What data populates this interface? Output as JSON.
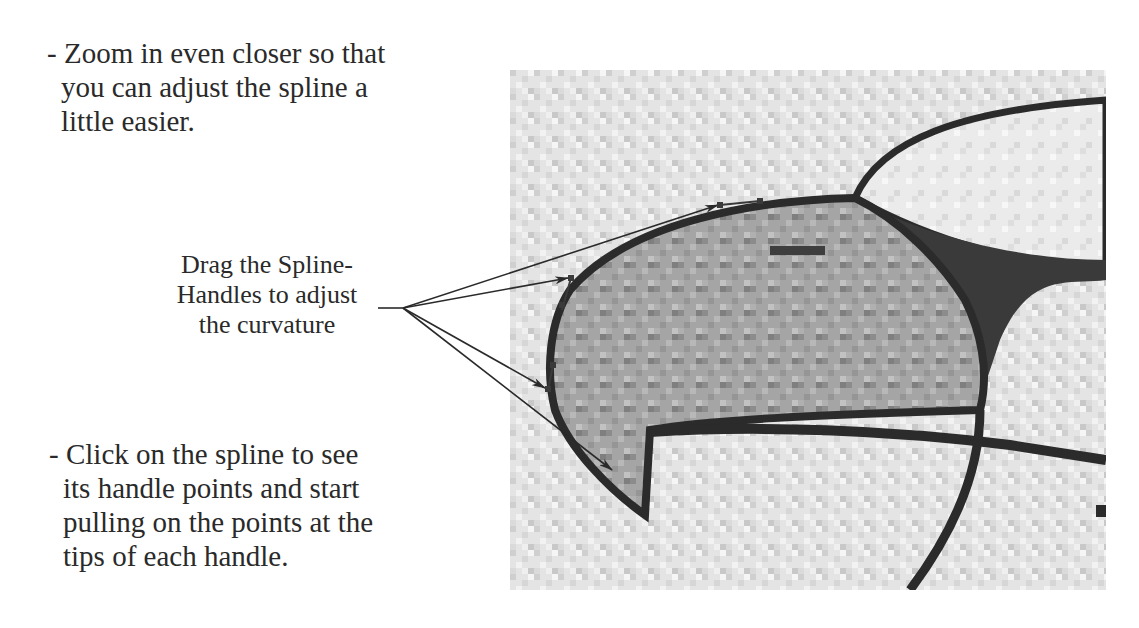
{
  "instructions": {
    "top": {
      "bullet": "-",
      "lines": [
        "Zoom in even closer so that",
        "you can adjust the spline a",
        "little easier."
      ]
    },
    "bottom": {
      "bullet": "-",
      "lines": [
        "Click on the spline to see",
        "its handle points and start",
        "pulling on the points at the",
        "tips of each handle."
      ]
    }
  },
  "callout": {
    "lines": [
      "Drag the Spline-",
      "Handles to adjust",
      "the curvature"
    ],
    "arrow_count": 4
  },
  "illustration": {
    "description": "pixelated zoomed-in bird beak with spline handles",
    "colors": {
      "outline": "#2b2b2b",
      "beak_fill": "#9a9a9a",
      "background": "#d8d8d8",
      "dark_region": "#3a3a3a"
    }
  },
  "icons": {
    "arrow": "arrow-icon",
    "spline_handle": "spline-handle-icon"
  }
}
